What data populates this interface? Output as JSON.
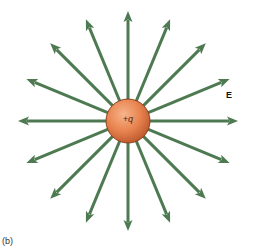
{
  "figure": {
    "panel_label": "(b)",
    "field_label": "E",
    "charge_label": "+q",
    "center": [
      128,
      121
    ],
    "charge_radius": 22,
    "arrow_count": 16,
    "arrow_length": 110,
    "colors": {
      "field_line": "#4e7a52",
      "charge_light": "#f6b48a",
      "charge_mid": "#e8834f",
      "charge_dark": "#b9552a",
      "charge_edge": "#8a3f1f"
    }
  }
}
